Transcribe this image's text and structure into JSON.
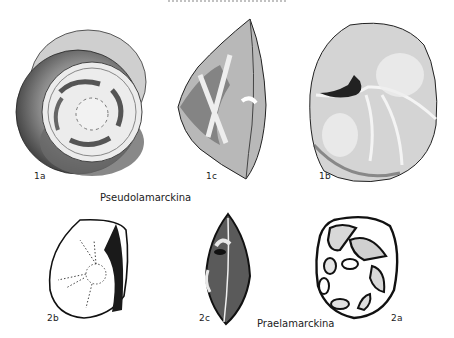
{
  "figure": {
    "type": "scientific plate (foraminifera drawings)",
    "genera": [
      {
        "name": "Pseudolamarckina",
        "views": [
          {
            "label": "1a",
            "view": "dorsal (spiral) view"
          },
          {
            "label": "1c",
            "view": "edge view"
          },
          {
            "label": "1b",
            "view": "ventral (umbilical) view"
          }
        ]
      },
      {
        "name": "Praelamarckina",
        "views": [
          {
            "label": "2b",
            "view": "ventral view"
          },
          {
            "label": "2c",
            "view": "edge view"
          },
          {
            "label": "2a",
            "view": "dorsal view"
          }
        ]
      }
    ]
  },
  "labels": {
    "fig_1a": "1a",
    "fig_1c": "1c",
    "fig_1b": "1b",
    "fig_2b": "2b",
    "fig_2c": "2c",
    "fig_2a": "2a",
    "genus_1": "Pseudolamarckina",
    "genus_2": "Praelamarckina"
  },
  "colors": {
    "ink": "#111111",
    "stipple_dark": "#555555",
    "stipple_light": "#bdbdbd",
    "paper": "#ffffff"
  }
}
